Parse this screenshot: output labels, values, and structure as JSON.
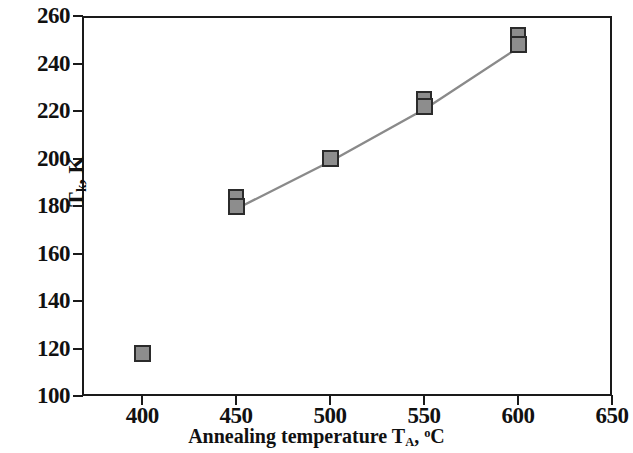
{
  "chart_data": {
    "type": "scatter",
    "title": "",
    "subtitle": "",
    "xlabel": "Annealing temperature T_A, °C",
    "ylabel": "T_k, K",
    "xlim": [
      368,
      650
    ],
    "ylim": [
      100,
      260
    ],
    "grid": false,
    "legend": null,
    "xticks": [
      400,
      450,
      500,
      550,
      600,
      650
    ],
    "yticks": [
      100,
      120,
      140,
      160,
      180,
      200,
      220,
      240,
      260
    ],
    "series": [
      {
        "name": "isolated-point",
        "connected": false,
        "x": [
          400
        ],
        "y": [
          118
        ],
        "marker": "filled-gray-square"
      },
      {
        "name": "annealed-series",
        "connected": true,
        "x": [
          450,
          500,
          550,
          600
        ],
        "y": [
          180,
          200,
          222,
          248
        ],
        "marker": "filled-gray-square",
        "duplicate_markers": [
          {
            "x": 450,
            "y": 184
          },
          {
            "x": 550,
            "y": 225
          },
          {
            "x": 600,
            "y": 252
          }
        ]
      }
    ],
    "colors": {
      "marker_fill": "#8d8d8d",
      "marker_edge": "#2b2b2b",
      "line": "#8a8a8a",
      "axis": "#1a1a1a",
      "background": "#ffffff"
    }
  },
  "axes": {
    "y": {
      "title_main": "T",
      "title_sub": "k",
      "title_unit": ", K",
      "tick_labels": [
        "260",
        "240",
        "220",
        "200",
        "180",
        "160",
        "140",
        "120",
        "100"
      ]
    },
    "x": {
      "title_main": "Annealing temperature T",
      "title_sub": "A",
      "title_unit": ", °C",
      "tick_labels": [
        "400",
        "450",
        "500",
        "550",
        "600",
        "650"
      ]
    }
  }
}
